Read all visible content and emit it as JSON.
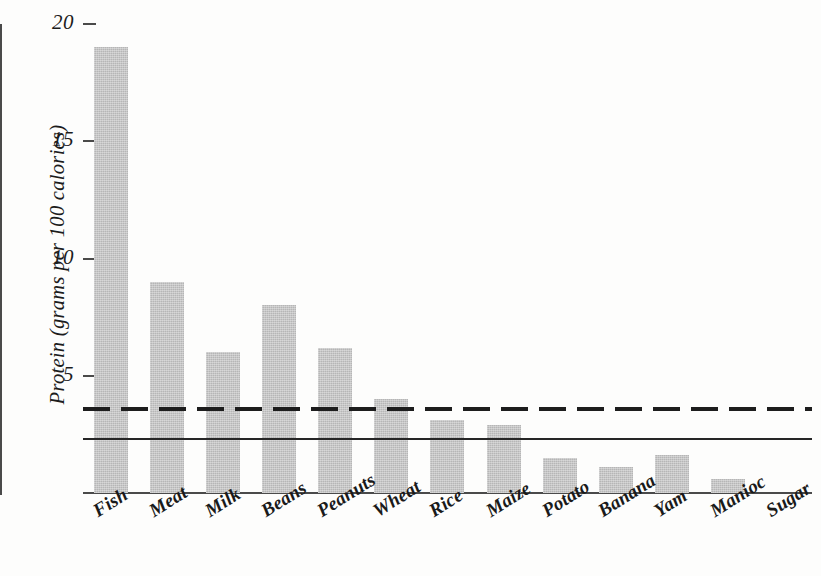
{
  "chart_data": {
    "type": "bar",
    "title": "",
    "subtitle": "",
    "xlabel": "",
    "ylabel": "Protein (grams per 100 calories)",
    "categories": [
      "Fish",
      "Meat",
      "Milk",
      "Beans",
      "Peanuts",
      "Wheat",
      "Rice",
      "Maize",
      "Potato",
      "Banana",
      "Yam",
      "Manioc",
      "Sugar"
    ],
    "values": [
      19.0,
      9.0,
      6.0,
      8.0,
      6.2,
      4.0,
      3.1,
      2.9,
      1.5,
      1.1,
      1.6,
      0.6,
      0.0
    ],
    "ylim": [
      0,
      20
    ],
    "xlim_note": "13 equally spaced categories",
    "yticks": [
      5,
      10,
      15,
      20
    ],
    "ytick_labels": [
      "5",
      "10",
      "15",
      "20"
    ],
    "grid": false,
    "legend": "none",
    "bar_color": "#b6b6b6",
    "axis_color": "#4a4a4a",
    "text_color": "#1c1c1c",
    "reference_lines": [
      {
        "name": "dashed-reference-line",
        "value": 3.6,
        "style": "dashed",
        "color": "#1d1d1d"
      },
      {
        "name": "solid-reference-line",
        "value": 2.3,
        "style": "solid",
        "color": "#262626"
      }
    ],
    "annotations": []
  },
  "figure": {
    "background": "#fdfdfc",
    "width": 821,
    "height": 576
  }
}
